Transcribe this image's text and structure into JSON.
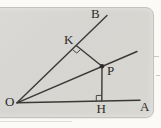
{
  "figure": {
    "type": "geometry-diagram",
    "labels": {
      "O": "O",
      "B": "B",
      "K": "K",
      "P": "P",
      "H": "H",
      "A": "A"
    },
    "elements": {
      "rays_from_O": [
        "ray OB",
        "ray through P",
        "ray OA"
      ],
      "segments": [
        "KP perpendicular to OB",
        "PH perpendicular to OA"
      ],
      "right_angle_marks": [
        "at K",
        "at H"
      ],
      "marked_point": "P"
    },
    "colors": {
      "box_background": "#d7d6d2",
      "page_background": "#fbfaf7",
      "line": "#3a3935",
      "label": "#2b2a28"
    }
  }
}
